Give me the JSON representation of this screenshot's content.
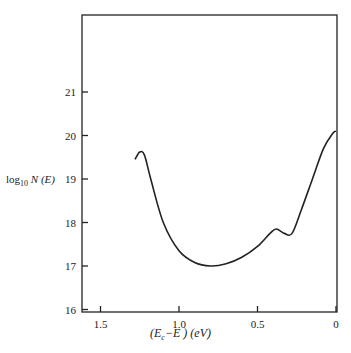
{
  "chart_data": {
    "type": "line",
    "title": "",
    "xlabel": "(E_c − E) (eV)",
    "ylabel": "log10 N(E)",
    "xlim": [
      1.6,
      0
    ],
    "ylim": [
      16,
      22.7
    ],
    "x_ticks": [
      "1.5",
      "1.0",
      "0.5",
      "0"
    ],
    "y_ticks": [
      "16",
      "17",
      "18",
      "19",
      "20",
      "21"
    ],
    "grid": false,
    "series": [
      {
        "name": "N(E)",
        "x": [
          1.28,
          1.25,
          1.22,
          1.18,
          1.1,
          1.0,
          0.9,
          0.8,
          0.7,
          0.6,
          0.5,
          0.42,
          0.38,
          0.33,
          0.28,
          0.22,
          0.15,
          0.08,
          0.02,
          0
        ],
        "y": [
          19.45,
          19.62,
          19.55,
          19.0,
          18.0,
          17.35,
          17.08,
          17.0,
          17.05,
          17.2,
          17.45,
          17.75,
          17.85,
          17.75,
          17.75,
          18.3,
          19.0,
          19.7,
          20.05,
          20.1
        ]
      }
    ]
  },
  "axis": {
    "ylabel_main": "log",
    "ylabel_sub": "10",
    "ylabel_rest": "N (E)",
    "xlabel_a": "(E",
    "xlabel_sub": "c",
    "xlabel_b": "−E ) (eV)"
  }
}
